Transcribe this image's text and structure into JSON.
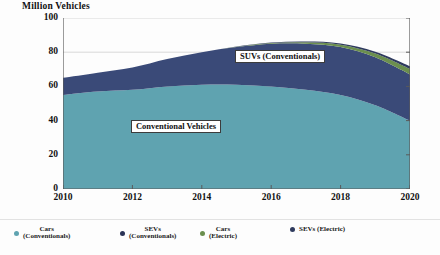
{
  "chart_data": {
    "type": "area",
    "stacked": true,
    "title": "",
    "subtitle": "",
    "xlabel": "",
    "ylabel": "Million Vehicles",
    "ylim": [
      0,
      100
    ],
    "xlim": [
      2010,
      2020
    ],
    "grid": true,
    "grid_axis": "y",
    "legend_position": "bottom",
    "x": [
      2010,
      2011,
      2012,
      2013,
      2014,
      2015,
      2016,
      2017,
      2018,
      2019,
      2020
    ],
    "yticks": [
      0,
      20,
      40,
      60,
      80,
      100
    ],
    "xticks": [
      2010,
      2012,
      2014,
      2016,
      2018,
      2020
    ],
    "series": [
      {
        "name": "Cars (Conventionals)",
        "color": "#5FA3B0",
        "values": [
          55,
          57,
          58,
          60,
          61,
          61,
          60,
          58,
          55,
          49,
          40
        ]
      },
      {
        "name": "SUVs (Conventionals)",
        "color": "#3A4A78",
        "values": [
          10,
          11,
          13,
          16,
          19,
          22,
          25,
          27,
          28,
          28,
          27
        ]
      },
      {
        "name": "Cars (Electric)",
        "color": "#6B8F4E",
        "values": [
          0,
          0,
          0,
          0,
          0,
          0.2,
          0.4,
          0.8,
          1.4,
          2.2,
          3.2
        ]
      },
      {
        "name": "SUVs (Electric)",
        "color": "#2F3B5E",
        "values": [
          0,
          0,
          0,
          0,
          0,
          0.1,
          0.2,
          0.4,
          0.7,
          1.1,
          1.6
        ]
      }
    ],
    "annotations": [
      {
        "text": "SUVs (Conventionals)",
        "x": 2016.4,
        "y": 78
      },
      {
        "text": "Conventional Vehicles",
        "x": 2013.4,
        "y": 37
      }
    ]
  },
  "axis": {
    "y_title": "Million Vehicles",
    "y_labels": [
      "100",
      "80",
      "60",
      "40",
      "20",
      "0"
    ],
    "x_labels": [
      "2010",
      "2012",
      "2014",
      "2016",
      "2018",
      "2020"
    ]
  },
  "annotations": {
    "suv_conventionals": "SUVs (Conventionals)",
    "conventional_vehicles": "Conventional Vehicles"
  },
  "legend": {
    "items": [
      {
        "label": "Cars\n(Conventionals)",
        "color": "#5FA3B0"
      },
      {
        "label": "SEVs\n(Conventionals)",
        "color": "#2A3356"
      },
      {
        "label": "Cars\n(Electric)",
        "color": "#6B8F4E"
      },
      {
        "label": "SEVs (Electric)",
        "color": "#2F3B5E"
      }
    ]
  }
}
